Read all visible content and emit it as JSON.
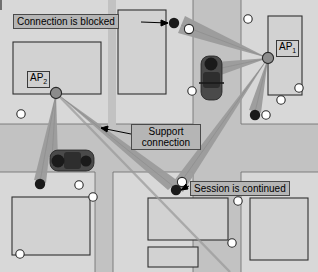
{
  "figure": {
    "type": "network-topology-map",
    "background": "#ffffff"
  },
  "colors": {
    "road": "#c2c2c2",
    "block": "#d8d8d8",
    "building_fill": "#d2d2d2",
    "building_stroke": "#303030",
    "beam": "#9c9c9c",
    "node_ap": "#8c8c8c",
    "node_user": "#1a1a1a",
    "node_white": "#ffffff",
    "tree_stroke": "#2a2a2a",
    "car_body": "#4a4a4a",
    "car_dark": "#1e1e1e",
    "label_fill": "#b5b5b5",
    "label_stroke": "#4a4a4a",
    "leader_line": "#000000"
  },
  "labels": {
    "connection_blocked": "Connection is blocked",
    "support_connection_line1": "Support",
    "support_connection_line2": "connection",
    "session_continued": "Session is continued"
  },
  "access_points": [
    {
      "id": "AP1",
      "prefix": "AP",
      "sub": "1",
      "x": 268,
      "y": 58
    },
    {
      "id": "AP2",
      "prefix": "AP",
      "sub": "2",
      "x": 56,
      "y": 93
    }
  ],
  "user_nodes": [
    {
      "name": "blocked-user-node",
      "x": 174,
      "y": 23,
      "color": "#1a1a1a"
    },
    {
      "name": "blocked-user-node-ghost",
      "x": 189,
      "y": 29,
      "color": "#ffffff"
    },
    {
      "name": "ap1-south-user-node",
      "x": 255,
      "y": 115,
      "color": "#1a1a1a"
    },
    {
      "name": "handover-user-node",
      "x": 176,
      "y": 190,
      "color": "#1a1a1a"
    },
    {
      "name": "handover-user-node-ghost",
      "x": 182,
      "y": 182,
      "color": "#ffffff"
    },
    {
      "name": "ap2-south-user-node",
      "x": 40,
      "y": 184,
      "color": "#1a1a1a"
    }
  ],
  "beams": [
    {
      "name": "beam-ap1-to-blocked",
      "from": "AP1",
      "to": "blocked-user-node"
    },
    {
      "name": "beam-ap1-to-car",
      "from": "AP1",
      "to": "car-vertical"
    },
    {
      "name": "beam-ap1-to-south-user",
      "from": "AP1",
      "to": "ap1-south-user-node"
    },
    {
      "name": "beam-ap1-to-handover",
      "from": "AP1",
      "to": "handover-user-node"
    },
    {
      "name": "beam-ap2-to-south-user",
      "from": "AP2",
      "to": "ap2-south-user-node"
    },
    {
      "name": "beam-ap2-to-car",
      "from": "AP2",
      "to": "car-horizontal"
    },
    {
      "name": "beam-ap2-to-handover",
      "from": "AP2",
      "to": "handover-user-node"
    }
  ],
  "cars": [
    {
      "name": "car-vertical",
      "x": 211,
      "y": 78,
      "orientation": "vertical"
    },
    {
      "name": "car-horizontal",
      "x": 71,
      "y": 161,
      "orientation": "horizontal"
    }
  ],
  "trees": [
    {
      "x": 192,
      "y": 91
    },
    {
      "x": 248,
      "y": 19
    },
    {
      "x": 281,
      "y": 100
    },
    {
      "x": 298,
      "y": 88
    },
    {
      "x": 266,
      "y": 115
    },
    {
      "x": 21,
      "y": 114
    },
    {
      "x": 79,
      "y": 185
    },
    {
      "x": 93,
      "y": 198
    },
    {
      "x": 20,
      "y": 255
    },
    {
      "x": 238,
      "y": 201
    },
    {
      "x": 232,
      "y": 243
    },
    {
      "x": 252,
      "y": 198
    }
  ]
}
